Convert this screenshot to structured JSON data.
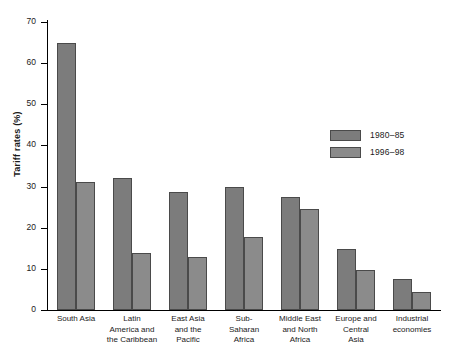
{
  "chart_data": {
    "type": "bar",
    "title": "",
    "xlabel": "",
    "ylabel": "Tariff rates (%)",
    "ylim": [
      0,
      70
    ],
    "yticks": [
      0,
      10,
      20,
      30,
      40,
      50,
      60,
      70
    ],
    "grid": false,
    "legend_position": "inside-upper-right",
    "categories": [
      "South Asia",
      "Latin\nAmerica and\nthe Caribbean",
      "East Asia\nand the\nPacific",
      "Sub-\nSaharan\nAfrica",
      "Middle East\nand North\nAfrica",
      "Europe and\nCentral\nAsia",
      "Industrial\neconomies"
    ],
    "series": [
      {
        "name": "1980–85",
        "color": "#7c7c7c",
        "values": [
          65.0,
          32.1,
          28.8,
          29.8,
          27.5,
          14.8,
          7.6
        ]
      },
      {
        "name": "1996–98",
        "color": "#8b8b8b",
        "values": [
          31.0,
          13.9,
          12.8,
          17.7,
          24.5,
          9.7,
          4.4
        ]
      }
    ]
  },
  "legend": {
    "items": [
      {
        "label": "1980–85"
      },
      {
        "label": "1996–98"
      }
    ]
  }
}
